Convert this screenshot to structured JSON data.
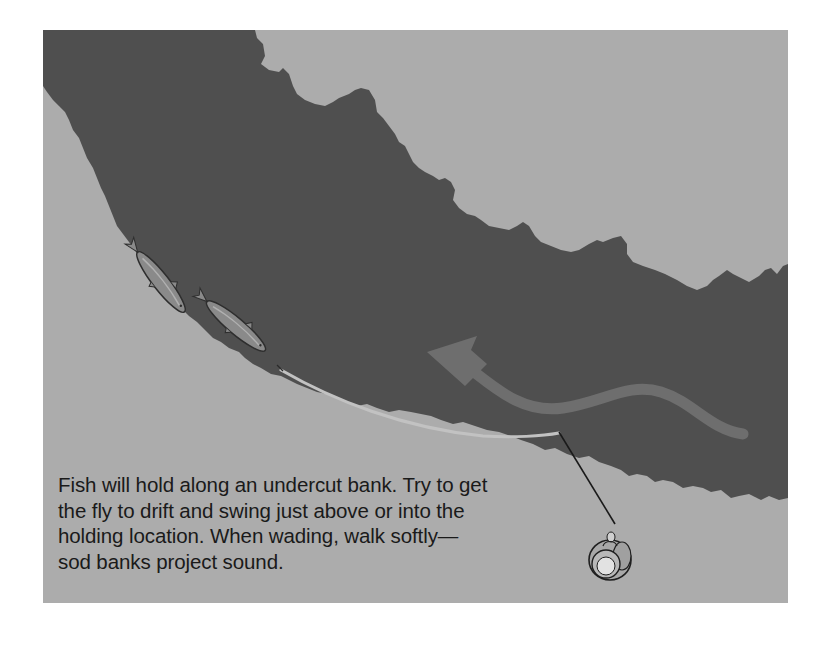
{
  "figure": {
    "type": "illustration",
    "colors": {
      "bank": "#acacac",
      "water": "#4f4f4f",
      "current_arrow": "#6e6e6e",
      "fly_line": "#c9c9c9",
      "leader": "#1a1a1a",
      "fish_body": "#8a8a8a",
      "fish_outline": "#2e2e2e",
      "angler_outline": "#1f1f1f",
      "angler_fill": "#b8b8b8",
      "caption_text": "#1a1a1a"
    },
    "elements": {
      "upper_bank": "upper-bank",
      "lower_bank": "lower-bank",
      "river": "river-water",
      "fish": [
        "trout-1",
        "trout-2"
      ],
      "current": "current-arrow",
      "line": "fly-line",
      "angler": "angler-top-view"
    }
  },
  "caption": {
    "lines": [
      "Fish will hold along an undercut bank. Try to get",
      "the fly to drift and swing just above or into the",
      "holding location. When wading, walk softly—",
      "sod banks project sound."
    ]
  }
}
